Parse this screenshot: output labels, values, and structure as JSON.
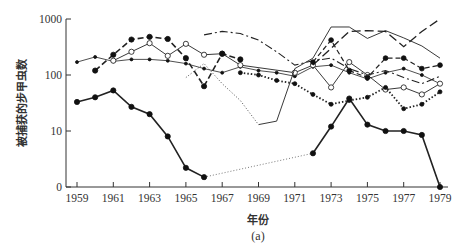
{
  "chart_data": {
    "type": "line",
    "title": "",
    "caption": "(a)",
    "xlabel": "年份",
    "ylabel": "被捕获的步甲虫数",
    "yscale": "log",
    "y_ticks": [
      "1000",
      "100",
      "10",
      "0"
    ],
    "x_ticks": [
      "1959",
      "1961",
      "1963",
      "1965",
      "1967",
      "1969",
      "1971",
      "1973",
      "1975",
      "1977",
      "1979"
    ],
    "xlim": [
      1959,
      1979
    ],
    "ylim": [
      0,
      1000
    ],
    "grid": false,
    "legend": null,
    "series": [
      {
        "name": "series-1 (solid, filled dots, lowest)",
        "style": "solid-bold-dots",
        "x": [
          1959,
          1960,
          1961,
          1962,
          1963,
          1964,
          1965,
          1966,
          1972,
          1973,
          1974,
          1975,
          1976,
          1977,
          1978,
          1979
        ],
        "values": [
          33,
          40,
          53,
          27,
          20,
          8,
          2.2,
          1.5,
          4,
          12,
          38,
          13,
          10,
          10,
          8.5,
          0
        ],
        "gap_style_1966_1972": "dotted"
      },
      {
        "name": "series-2 (thin solid, small dots)",
        "style": "solid-thin-smalldots",
        "x": [
          1959,
          1960,
          1961,
          1962,
          1963,
          1964,
          1965,
          1966,
          1967,
          1968,
          1969,
          1970,
          1971,
          1972,
          1973,
          1974,
          1975,
          1976,
          1977,
          1978,
          1979
        ],
        "values": [
          170,
          210,
          175,
          190,
          190,
          180,
          160,
          130,
          110,
          140,
          120,
          110,
          95,
          140,
          150,
          110,
          85,
          110,
          130,
          100,
          70
        ]
      },
      {
        "name": "series-3 (open circles)",
        "style": "solid-open-circles",
        "x": [
          1961,
          1962,
          1963,
          1964,
          1965,
          1966,
          1967,
          1968,
          1971,
          1972,
          1973,
          1974,
          1975,
          1976,
          1977,
          1978,
          1979
        ],
        "values": [
          180,
          260,
          370,
          220,
          360,
          230,
          240,
          150,
          110,
          150,
          60,
          170,
          100,
          55,
          60,
          45,
          70
        ]
      },
      {
        "name": "series-4 (bold dashed, filled dots)",
        "style": "dashed-bold-dots",
        "x": [
          1960,
          1961,
          1962,
          1963,
          1964,
          1965,
          1966,
          1967,
          1968
        ],
        "values": [
          120,
          230,
          430,
          480,
          440,
          200,
          63,
          240,
          190
        ]
      },
      {
        "name": "series-5 (dash-dot)",
        "style": "dashdot",
        "x": [
          1966,
          1967,
          1968,
          1969,
          1970,
          1971,
          1972,
          1973,
          1974,
          1975,
          1976,
          1977,
          1978,
          1979
        ],
        "values": [
          520,
          600,
          550,
          420,
          260,
          150,
          180,
          200,
          130,
          100,
          120,
          90,
          70,
          95
        ]
      },
      {
        "name": "series-6 (thin solid grey)",
        "style": "solid-thin",
        "x": [
          1969,
          1970,
          1971,
          1972,
          1973,
          1974,
          1975,
          1976,
          1977,
          1978,
          1979
        ],
        "values": [
          13,
          15,
          130,
          200,
          720,
          720,
          450,
          620,
          460,
          330,
          200
        ]
      },
      {
        "name": "series-7 (long dash)",
        "style": "longdash",
        "x": [
          1972,
          1973,
          1974,
          1975,
          1976,
          1977,
          1978,
          1979
        ],
        "values": [
          150,
          300,
          600,
          620,
          600,
          320,
          600,
          1000
        ]
      },
      {
        "name": "series-8 (heavy dotted, filled dots)",
        "style": "dotted-bold-dots",
        "x": [
          1968,
          1969,
          1970,
          1971,
          1972,
          1973,
          1974,
          1975,
          1976,
          1977,
          1978,
          1979
        ],
        "values": [
          110,
          100,
          80,
          70,
          45,
          30,
          35,
          40,
          60,
          25,
          30,
          50
        ]
      },
      {
        "name": "series-9 (dashed, filled dots upper)",
        "style": "dashed-dots",
        "x": [
          1972,
          1973,
          1974,
          1975,
          1976,
          1977,
          1978,
          1979
        ],
        "values": [
          170,
          420,
          120,
          90,
          200,
          200,
          130,
          150
        ]
      },
      {
        "name": "series-10 (dotted thin)",
        "style": "dotted-thin",
        "x": [
          1965,
          1966,
          1967,
          1968,
          1969
        ],
        "values": [
          90,
          160,
          70,
          35,
          13
        ]
      }
    ]
  }
}
